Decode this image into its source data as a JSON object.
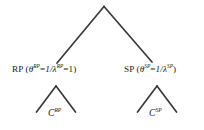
{
  "diagram": {
    "type": "tree",
    "background_color": "#ffffff",
    "line_color": "#3a3a3a",
    "root": {
      "apex_label": ""
    },
    "nodes": [
      {
        "id": "rp",
        "name_prefix": "RP",
        "open_paren": " (",
        "theta_symbol": "θ",
        "theta_sup": "RP",
        "equals_1": "=",
        "one_over": "1/",
        "lambda_symbol": "λ",
        "lambda_sup": "RP",
        "equals_2": "=1",
        "close_paren": ")",
        "full_text": "RP (θRP=1/λRP=1)"
      },
      {
        "id": "sp",
        "name_prefix": "SP",
        "open_paren": " (",
        "theta_symbol": "θ",
        "theta_sup": "SP",
        "equals_1": "=",
        "one_over": "1/",
        "lambda_symbol": "λ",
        "lambda_sup": "SP",
        "equals_2": "",
        "close_paren": ")",
        "full_text": "SP (θSP=1/λSP)"
      }
    ],
    "leaves": [
      {
        "id": "c-rp",
        "symbol": "C",
        "superscript": "RP",
        "full_text": "CRP"
      },
      {
        "id": "c-sp",
        "symbol": "C",
        "superscript": "SP",
        "full_text": "CSP"
      }
    ]
  }
}
